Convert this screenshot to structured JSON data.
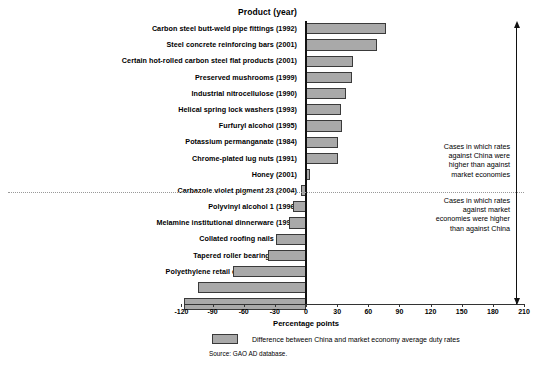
{
  "chart_data": {
    "type": "bar",
    "orientation": "horizontal",
    "title": "",
    "xlabel": "Percentage points",
    "ylabel": "Product (year)",
    "xlim": [
      -120,
      210
    ],
    "xticks": [
      -120,
      -90,
      -60,
      -30,
      0,
      30,
      60,
      90,
      120,
      150,
      180,
      210
    ],
    "xtick_labels": [
      "-120",
      "-90",
      "-60",
      "-30",
      "0",
      "30",
      "60",
      "90",
      "120",
      "150",
      "180",
      "210"
    ],
    "grid": false,
    "legend_position": "below-axis",
    "legend": [
      "Difference between China and market economy average duty rates"
    ],
    "series_color": "#a9a9a9",
    "categories": [
      "Carbon steel butt-weld pipe fittings (1992)",
      "Steel concrete reinforcing bars (2001)",
      "Certain hot-rolled carbon steel flat products (2001)",
      "Preserved mushrooms (1999)",
      "Industrial nitrocellulose (1990)",
      "Helical spring lock washers (1993)",
      "Furfuryl alcohol (1995)",
      "Potassium permanganate (1984)",
      "Chrome-plated lug nuts (1991)",
      "Honey (2001)",
      "Carbazole violet pigment 23 (2004)",
      "Polyvinyl alcohol 1 (1996)",
      "Melamine institutional dinnerware (1997)",
      "Collated roofing nails (1997)",
      "Tapered roller bearings (1987)",
      "Polyethylene retail carrier bags (2004)",
      "Ferrovanadium (2003)",
      "Polyvinyl alcohol 2 (2003)"
    ],
    "values": [
      77,
      68,
      45,
      44,
      39,
      34,
      35,
      31,
      31,
      4,
      -5,
      -13,
      -16,
      -29,
      -37,
      -70,
      -104,
      -118
    ],
    "annotations": [
      "Cases in which rates\nagainst China were\nhigher than against\nmarket economies",
      "Cases in which rates\nagainst market\neconomies were higher\nthan against China"
    ],
    "source_note": "Source: GAO AD database."
  },
  "axis": {
    "y_header": "Product (year)",
    "x_title": "Percentage points"
  },
  "legend": {
    "label": "Difference between China and market economy average duty rates"
  },
  "footer": {
    "source": "Source: GAO AD database."
  },
  "annotations": {
    "top": "Cases in which rates\nagainst China were\nhigher than against\nmarket economies",
    "bottom": "Cases in which rates\nagainst market\neconomies were higher\nthan against China"
  },
  "colors": {
    "bar_fill": "#a9a9a9",
    "bar_border": "#3a3a3a",
    "axis": "#111111"
  }
}
